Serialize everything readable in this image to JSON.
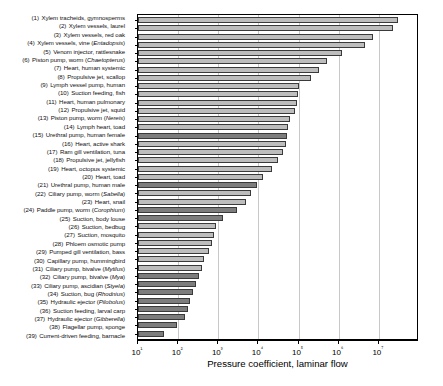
{
  "chart_data": {
    "type": "bar",
    "orientation": "horizontal",
    "title": "",
    "xlabel": "Pressure coefficient, laminar flow",
    "ylabel": "",
    "xscale": "log",
    "xlim": [
      10,
      100000000
    ],
    "xticks": [
      10,
      100,
      1000,
      10000,
      100000,
      1000000,
      10000000
    ],
    "xticklabels": [
      "10¹",
      "10²",
      "10³",
      "10⁴",
      "10⁵",
      "10⁶",
      "10⁷"
    ],
    "grid": "vertical",
    "legend": "none",
    "categories": [
      "Xylem tracheids, gymnosperms",
      "Xylem vessels, laurel",
      "Xylem vessels, red oak",
      "Xylem vessels, vine (Entadopsis)",
      "Venom injector, rattlesnake",
      "Piston pump, worm (Chaetopterus)",
      "Heart, human systemic",
      "Propulsive jet, scallop",
      "Lymph vessel pump, human",
      "Suction feeding, fish",
      "Heart, human pulmonary",
      "Propulsive jet, squid",
      "Piston pump, worm (Nereis)",
      "Lymph heart, toad",
      "Urethral pump, human female",
      "Heart, active shark",
      "Ram gill ventilation, tuna",
      "Propulsive jet, jellyfish",
      "Heart, octopus systemic",
      "Heart, toad",
      "Urethral pump, human male",
      "Ciliary pump, worm (Sabella)",
      "Heart, snail",
      "Paddle pump, worm (Corophium)",
      "Suction, body louse",
      "Suction, bedbug",
      "Suction, mosquito",
      "Phloem osmotic pump",
      "Pumped gill ventilation, bass",
      "Capillary pump, hummingbird",
      "Ciliary pump, bivalve (Mytilus)",
      "Ciliary pump, bivalve (Mya)",
      "Ciliary pump, ascidian (Styela)",
      "Suction, bug (Rhodnius)",
      "Hydraulic ejector (Pilobolus)",
      "Suction feeding, larval carp",
      "Hydraulic ejector (Gibberella)",
      "Flagellar pump, sponge",
      "Current-driven feeding, barnacle"
    ],
    "values": [
      30000000,
      22000000,
      7000000,
      4500000,
      1200000,
      500000,
      330000,
      200000,
      100000,
      95000,
      90000,
      80000,
      60000,
      55000,
      52000,
      48000,
      40000,
      30000,
      22000,
      13000,
      9000,
      6500,
      5000,
      3000,
      1300,
      900,
      800,
      700,
      600,
      430,
      400,
      330,
      280,
      230,
      200,
      180,
      150,
      95,
      45
    ],
    "bar_shades": [
      "light",
      "light",
      "light",
      "light",
      "light",
      "light",
      "light",
      "light",
      "light",
      "light",
      "light",
      "light",
      "light",
      "light",
      "dark",
      "light",
      "light",
      "light",
      "light",
      "light",
      "dark",
      "light",
      "light",
      "dark",
      "dark",
      "light",
      "light",
      "light",
      "light",
      "light",
      "light",
      "dark",
      "dark",
      "dark",
      "dark",
      "dark",
      "dark",
      "dark",
      "dark"
    ],
    "italic_parts": {
      "4": "Entadopsis",
      "6": "Chaetopterus",
      "13": "Nereis",
      "22": "Sabella",
      "24": "Corophium",
      "31": "Mytilus",
      "32": "Mya",
      "33": "Styela",
      "34": "Rhodnius",
      "35": "Pilobolus",
      "37": "Gibberella"
    }
  },
  "axis": {
    "xlabel": "Pressure coefficient, laminar flow"
  },
  "colors": {
    "bar_light": "#bdbdbd",
    "bar_dark": "#7d7d7d",
    "bar_edge": "#3a3a3a",
    "grid": "#c8c8c8",
    "axis": "#000000",
    "background": "#ffffff"
  }
}
